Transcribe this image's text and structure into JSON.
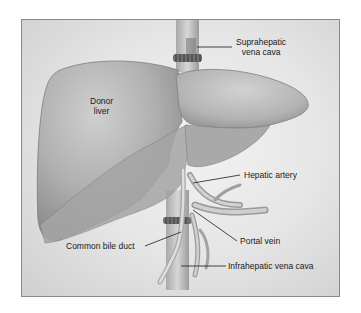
{
  "figure": {
    "type": "anatomical-illustration"
  },
  "labels": {
    "organ": {
      "line1": "Donor",
      "line2": "liver"
    },
    "suprahepatic_vena_cava": {
      "line1": "Suprahepatic",
      "line2": "vena cava"
    },
    "hepatic_artery": "Hepatic artery",
    "portal_vein": "Portal vein",
    "common_bile_duct": "Common bile duct",
    "infrahepatic_vena_cava": "Infrahepatic vena cava"
  },
  "colors": {
    "background": "#e8e8e8",
    "frame_border": "#8a8a8a",
    "liver_fill": "#b8b8b8",
    "liver_shadow": "#8e8e8e",
    "vessel": "#c9c9c9",
    "leader_line": "#1a1a1a"
  }
}
